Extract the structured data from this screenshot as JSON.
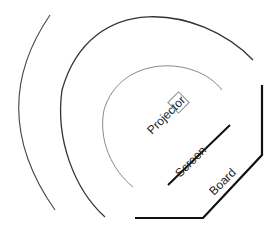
{
  "diagram": {
    "type": "room-layout",
    "labels": {
      "projector": "Projector",
      "screen": "Screen",
      "board": "Board"
    },
    "colors": {
      "outer_arc": "#444444",
      "middle_arc": "#333333",
      "inner_arc": "#888888",
      "projector_box": "#888888",
      "screen": "#111111",
      "board": "#111111",
      "text": "#222222"
    }
  }
}
